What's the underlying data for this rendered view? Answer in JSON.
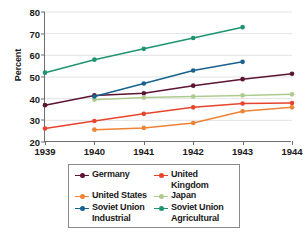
{
  "chart_data": {
    "type": "line",
    "title": "",
    "xlabel": "",
    "ylabel": "Percent",
    "categories": [
      "1939",
      "1940",
      "1941",
      "1942",
      "1943",
      "1944"
    ],
    "x": [
      1939,
      1940,
      1941,
      1942,
      1943,
      1944
    ],
    "xlim": [
      1939,
      1944
    ],
    "ylim": [
      20,
      80
    ],
    "yticks": [
      20,
      30,
      40,
      50,
      60,
      70,
      80
    ],
    "ytick_labels": [
      "20",
      "30",
      "40",
      "50",
      "60",
      "70",
      "80"
    ],
    "grid": true,
    "grid_axis": "y",
    "legend_position": "below-center",
    "legend_columns": 2,
    "markers": "circle",
    "series": [
      {
        "name": "Germany",
        "color": "#5b1433",
        "x": [
          1939,
          1940,
          1941,
          1942,
          1943,
          1944
        ],
        "values": [
          37,
          41.5,
          42.5,
          46,
          49,
          51.5
        ]
      },
      {
        "name": "United Kingdom",
        "color": "#e8442c",
        "x": [
          1939,
          1940,
          1941,
          1942,
          1943,
          1944
        ],
        "values": [
          26.2,
          29.7,
          33,
          36,
          37.8,
          38
        ]
      },
      {
        "name": "United States",
        "color": "#ef8235",
        "x": [
          1940,
          1941,
          1942,
          1943,
          1944
        ],
        "values": [
          25.7,
          26.5,
          28.8,
          34.2,
          36
        ]
      },
      {
        "name": "Japan",
        "color": "#aecb8f",
        "x": [
          1940,
          1941,
          1942,
          1943,
          1944
        ],
        "values": [
          39.5,
          40.5,
          41,
          41.5,
          42
        ]
      },
      {
        "name": "Soviet Union Industrial",
        "color": "#19618f",
        "x": [
          1940,
          1941,
          1942,
          1943
        ],
        "values": [
          41,
          47,
          53,
          57
        ]
      },
      {
        "name": "Soviet Union Agricultural",
        "color": "#1e9473",
        "x": [
          1939,
          1940,
          1941,
          1942,
          1943
        ],
        "values": [
          52,
          58,
          63,
          68,
          73
        ]
      }
    ]
  },
  "legend": {
    "entries": [
      {
        "label": "Germany",
        "label_line2": "",
        "color": "#5b1433"
      },
      {
        "label": "United Kingdom",
        "label_line2": "",
        "color": "#e8442c"
      },
      {
        "label": "United States",
        "label_line2": "",
        "color": "#ef8235"
      },
      {
        "label": "Japan",
        "label_line2": "",
        "color": "#aecb8f"
      },
      {
        "label": "Soviet Union",
        "label_line2": "Industrial",
        "color": "#19618f"
      },
      {
        "label": "Soviet Union",
        "label_line2": "Agricultural",
        "color": "#1e9473"
      }
    ]
  },
  "axis": {
    "y_title": "Percent",
    "axis_color": "#6e6e6e",
    "grid_color": "#e3e3e3"
  }
}
